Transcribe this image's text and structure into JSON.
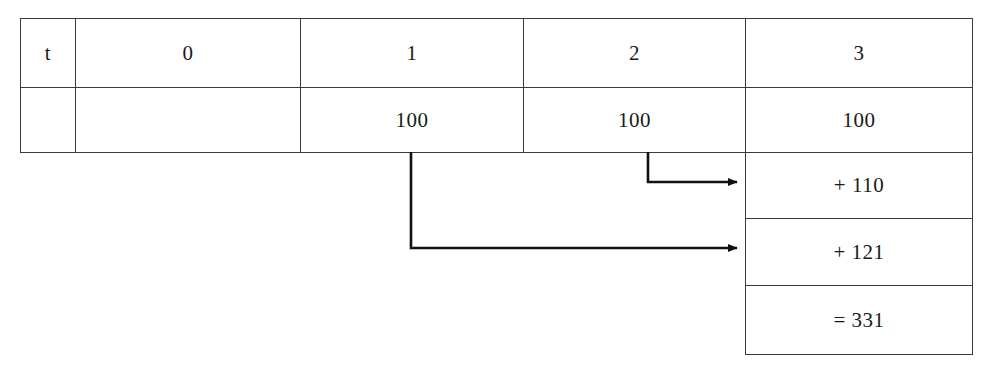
{
  "diagram": {
    "title_row_label": "t",
    "columns": [
      {
        "key": "t",
        "header": "t"
      },
      {
        "key": "c0",
        "header": "0"
      },
      {
        "key": "c1",
        "header": "1"
      },
      {
        "key": "c2",
        "header": "2"
      },
      {
        "key": "c3",
        "header": "3"
      }
    ],
    "value_row": {
      "t": "",
      "c0": "",
      "c1": "100",
      "c2": "100",
      "c3": "100"
    },
    "accumulation_cells": [
      {
        "key": "plus110",
        "text": "+ 110"
      },
      {
        "key": "plus121",
        "text": "+ 121"
      },
      {
        "key": "total",
        "text": "= 331"
      }
    ],
    "arrows": [
      {
        "name": "arrow-from-t2-to-plus110",
        "from_column": "2",
        "to_cell": "+ 110"
      },
      {
        "name": "arrow-from-t1-to-plus121",
        "from_column": "1",
        "to_cell": "+ 121"
      }
    ],
    "colors": {
      "border": "#3a3a3a",
      "text": "#1a1a1a",
      "arrow": "#111111",
      "background": "#ffffff"
    }
  }
}
